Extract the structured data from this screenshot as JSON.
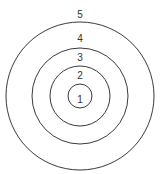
{
  "diagram": {
    "type": "concentric-circles",
    "center": [
      80,
      96
    ],
    "stroke_color": "#3a3a3a",
    "label_color": "#333333",
    "rings": [
      {
        "label": "1",
        "radius": 12,
        "label_pos": [
          80,
          103
        ]
      },
      {
        "label": "2",
        "radius": 30,
        "label_pos": [
          80,
          79
        ]
      },
      {
        "label": "3",
        "radius": 48,
        "label_pos": [
          80,
          61
        ]
      },
      {
        "label": "4",
        "radius": 60,
        "label_pos": [
          80,
          43
        ]
      },
      {
        "label": "5",
        "radius": 74,
        "label_pos": [
          80,
          18
        ]
      }
    ]
  }
}
